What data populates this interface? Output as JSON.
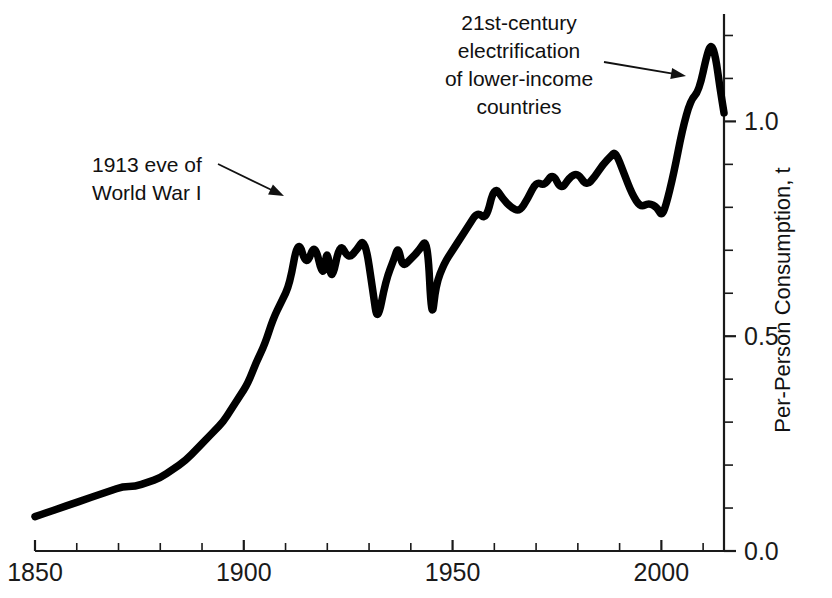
{
  "chart_data": {
    "type": "line",
    "title": "",
    "xlabel": "",
    "ylabel": "Per-Person Consumption, t",
    "xlim": [
      1850,
      2015
    ],
    "ylim": [
      0.0,
      1.25
    ],
    "grid": false,
    "legend": null,
    "x_ticks_major": [
      1850,
      1900,
      1950,
      2000
    ],
    "x_tick_labels": [
      "1850",
      "1900",
      "1950",
      "2000"
    ],
    "x_ticks_minor": [
      1860,
      1870,
      1880,
      1890,
      1910,
      1920,
      1930,
      1940,
      1960,
      1970,
      1980,
      1990,
      2010
    ],
    "y_ticks_major": [
      0.0,
      0.5,
      1.0
    ],
    "y_tick_labels": [
      "0.0",
      "0.5",
      "1.0"
    ],
    "y_ticks_minor": [
      0.1,
      0.2,
      0.3,
      0.4,
      0.6,
      0.7,
      0.8,
      0.9,
      1.1,
      1.2
    ],
    "series": [
      {
        "name": "Per-person consumption",
        "color": "#000000",
        "x": [
          1850,
          1853,
          1856,
          1859,
          1862,
          1865,
          1868,
          1871,
          1874,
          1877,
          1880,
          1883,
          1886,
          1889,
          1891,
          1893,
          1895,
          1897,
          1899,
          1901,
          1903,
          1905,
          1907,
          1909,
          1911,
          1913,
          1915,
          1917,
          1919,
          1920,
          1921,
          1923,
          1925,
          1927,
          1929,
          1931,
          1932,
          1934,
          1936,
          1937,
          1938,
          1940,
          1942,
          1944,
          1945,
          1946,
          1948,
          1950,
          1952,
          1954,
          1956,
          1958,
          1960,
          1962,
          1964,
          1966,
          1968,
          1970,
          1972,
          1974,
          1976,
          1978,
          1980,
          1982,
          1984,
          1986,
          1988,
          1989,
          1991,
          1993,
          1995,
          1997,
          1999,
          2000,
          2001,
          2003,
          2005,
          2007,
          2009,
          2011,
          2012,
          2013,
          2014,
          2015
        ],
        "y": [
          0.08,
          0.09,
          0.1,
          0.11,
          0.12,
          0.13,
          0.14,
          0.15,
          0.15,
          0.16,
          0.17,
          0.19,
          0.21,
          0.24,
          0.26,
          0.28,
          0.3,
          0.33,
          0.36,
          0.39,
          0.44,
          0.48,
          0.54,
          0.58,
          0.62,
          0.73,
          0.66,
          0.72,
          0.63,
          0.71,
          0.62,
          0.72,
          0.68,
          0.7,
          0.73,
          0.6,
          0.53,
          0.63,
          0.68,
          0.71,
          0.66,
          0.68,
          0.7,
          0.73,
          0.53,
          0.62,
          0.67,
          0.7,
          0.73,
          0.76,
          0.79,
          0.77,
          0.85,
          0.82,
          0.8,
          0.79,
          0.82,
          0.86,
          0.85,
          0.88,
          0.84,
          0.87,
          0.88,
          0.85,
          0.87,
          0.9,
          0.92,
          0.93,
          0.88,
          0.83,
          0.8,
          0.81,
          0.8,
          0.78,
          0.8,
          0.88,
          0.98,
          1.05,
          1.07,
          1.16,
          1.18,
          1.15,
          1.08,
          1.02
        ]
      }
    ],
    "annotations": [
      {
        "id": "wwi",
        "lines": [
          "1913 eve of",
          "World War I"
        ],
        "align": "left",
        "text_x": 92,
        "text_y": 172,
        "line_height": 28,
        "arrow_from": [
          218,
          164
        ],
        "arrow_to": [
          284,
          196
        ]
      },
      {
        "id": "electrification",
        "lines": [
          "21st-century",
          "electrification",
          "of lower-income",
          "countries"
        ],
        "align": "center",
        "text_x": 519,
        "text_y": 30,
        "line_height": 28,
        "arrow_from": [
          604,
          62
        ],
        "arrow_to": [
          686,
          76
        ]
      }
    ]
  }
}
